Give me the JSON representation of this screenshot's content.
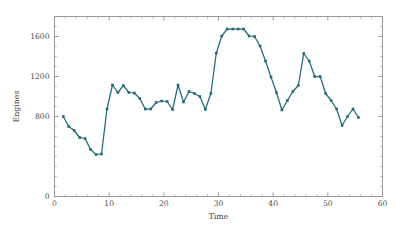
{
  "chart_data": {
    "type": "line",
    "title": "",
    "subtitle": "",
    "xlabel": "Time",
    "ylabel": "Engines",
    "xlim": [
      0,
      60
    ],
    "ylim": [
      0,
      1800
    ],
    "xticks": [
      0,
      10,
      20,
      30,
      40,
      50,
      60
    ],
    "xticklabels": [
      "0",
      "10",
      "20",
      "30",
      "40",
      "50",
      "60"
    ],
    "yticks": [
      0,
      800,
      1200,
      1600
    ],
    "yticklabels": [
      "0",
      "800",
      "1200",
      "1600"
    ],
    "y_minor_tick_step": 100,
    "x_minor_tick_step": 2,
    "grid": false,
    "legend": null,
    "series_color": "#1f6b78",
    "marker": "square",
    "marker_size": 2.6,
    "line_width": 1.25,
    "series": [
      {
        "name": "Engines",
        "x": [
          1.6,
          2.6,
          3.6,
          4.6,
          5.6,
          6.6,
          7.6,
          8.6,
          9.6,
          10.6,
          11.6,
          12.6,
          13.6,
          14.6,
          15.6,
          16.6,
          17.6,
          18.6,
          19.6,
          20.6,
          21.6,
          22.6,
          23.6,
          24.6,
          25.6,
          26.6,
          27.6,
          28.6,
          29.6,
          30.6,
          31.6,
          32.6,
          33.6,
          34.6,
          35.6,
          36.6,
          37.6,
          38.6,
          39.6,
          40.6,
          41.6,
          42.6,
          43.6,
          44.6,
          45.6,
          46.6,
          47.6,
          48.6,
          49.6,
          50.6,
          51.6,
          52.6,
          53.6,
          54.6,
          55.6
        ],
        "values": [
          800,
          700,
          660,
          590,
          580,
          470,
          420,
          425,
          875,
          1115,
          1040,
          1110,
          1040,
          1035,
          980,
          875,
          875,
          940,
          955,
          950,
          870,
          1115,
          945,
          1050,
          1030,
          1000,
          870,
          1030,
          1435,
          1605,
          1675,
          1675,
          1675,
          1675,
          1605,
          1600,
          1505,
          1355,
          1195,
          1040,
          865,
          960,
          1050,
          1110,
          1430,
          1355,
          1200,
          1200,
          1030,
          960,
          875,
          710,
          800,
          875,
          790
        ]
      }
    ]
  },
  "figure": {
    "background_color": "#ffffff",
    "axes_color": "#909090"
  }
}
